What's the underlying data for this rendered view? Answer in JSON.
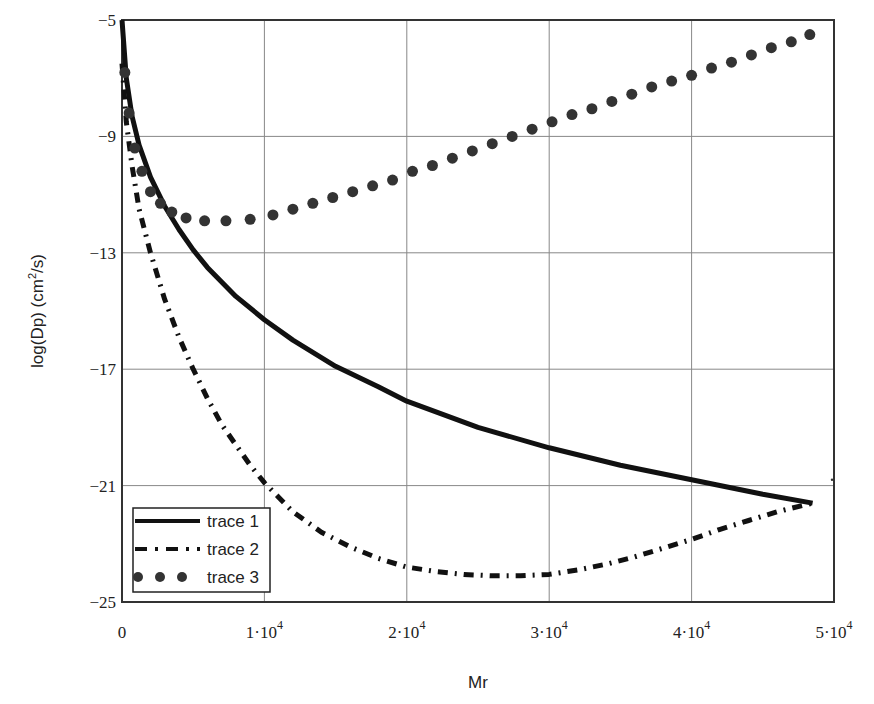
{
  "chart_data": {
    "type": "line",
    "title": "",
    "xlabel": "Mr",
    "ylabel": "log(Dp)  (cm²/s)",
    "xlim": [
      0,
      50000
    ],
    "ylim": [
      -25,
      -5
    ],
    "grid": true,
    "legend_position": "lower-left",
    "x_ticks": [
      {
        "value": 0,
        "label": "0",
        "exp": ""
      },
      {
        "value": 10000,
        "label": "1·10",
        "exp": "4"
      },
      {
        "value": 20000,
        "label": "2·10",
        "exp": "4"
      },
      {
        "value": 30000,
        "label": "3·10",
        "exp": "4"
      },
      {
        "value": 40000,
        "label": "4·10",
        "exp": "4"
      },
      {
        "value": 50000,
        "label": "5·10",
        "exp": "4"
      }
    ],
    "y_ticks": [
      {
        "value": -5,
        "label": "−5"
      },
      {
        "value": -9,
        "label": "−9"
      },
      {
        "value": -13,
        "label": "−13"
      },
      {
        "value": -17,
        "label": "−17"
      },
      {
        "value": -21,
        "label": "−21"
      },
      {
        "value": -25,
        "label": "−25"
      }
    ],
    "series": [
      {
        "name": "trace 1",
        "style": "solid",
        "color": "#111111",
        "x": [
          0,
          300,
          700,
          1200,
          2000,
          3000,
          4000,
          5000,
          6000,
          8000,
          10000,
          12000,
          15000,
          18000,
          20000,
          25000,
          30000,
          35000,
          40000,
          45000,
          48500
        ],
        "y": [
          -5.0,
          -7.0,
          -8.3,
          -9.3,
          -10.4,
          -11.4,
          -12.2,
          -12.9,
          -13.5,
          -14.5,
          -15.3,
          -16.0,
          -16.9,
          -17.6,
          -18.1,
          -19.0,
          -19.7,
          -20.3,
          -20.8,
          -21.3,
          -21.6
        ]
      },
      {
        "name": "trace 2",
        "style": "dash-dot",
        "color": "#111111",
        "x": [
          0,
          300,
          700,
          1200,
          2000,
          3000,
          4000,
          5000,
          6000,
          7000,
          8000,
          9000,
          10000,
          11000,
          12000,
          14000,
          16000,
          18000,
          20000,
          22000,
          24000,
          26000,
          28000,
          30000,
          32000,
          34000,
          36000,
          38000,
          40000,
          42000,
          44000,
          46000,
          48500
        ],
        "y": [
          -6.5,
          -8.5,
          -10.0,
          -11.5,
          -13.0,
          -14.6,
          -15.9,
          -17.0,
          -18.0,
          -18.9,
          -19.6,
          -20.3,
          -20.9,
          -21.4,
          -21.9,
          -22.6,
          -23.1,
          -23.5,
          -23.8,
          -23.95,
          -24.05,
          -24.1,
          -24.1,
          -24.05,
          -23.9,
          -23.7,
          -23.45,
          -23.15,
          -22.85,
          -22.5,
          -22.2,
          -21.9,
          -21.6
        ]
      },
      {
        "name": "trace 3",
        "style": "dots",
        "color": "#333333",
        "x": [
          200,
          500,
          900,
          1400,
          2000,
          2700,
          3500,
          4500,
          5800,
          7300,
          9000,
          10600,
          12000,
          13400,
          14800,
          16200,
          17600,
          19000,
          20400,
          21800,
          23200,
          24600,
          26000,
          27400,
          28800,
          30200,
          31600,
          33000,
          34400,
          35800,
          37200,
          38600,
          40000,
          41400,
          42800,
          44200,
          45600,
          47000,
          48300
        ],
        "y": [
          -6.8,
          -8.2,
          -9.4,
          -10.2,
          -10.9,
          -11.3,
          -11.6,
          -11.8,
          -11.9,
          -11.9,
          -11.85,
          -11.7,
          -11.5,
          -11.3,
          -11.1,
          -10.9,
          -10.7,
          -10.5,
          -10.2,
          -10.0,
          -9.75,
          -9.5,
          -9.25,
          -9.0,
          -8.75,
          -8.5,
          -8.25,
          -8.05,
          -7.8,
          -7.55,
          -7.3,
          -7.1,
          -6.9,
          -6.65,
          -6.45,
          -6.2,
          -5.95,
          -5.75,
          -5.5
        ]
      }
    ]
  },
  "legend": {
    "items": [
      {
        "label": "trace 1"
      },
      {
        "label": "trace 2"
      },
      {
        "label": "trace 3"
      }
    ]
  },
  "axes": {
    "x_title": "Mr",
    "y_title_main": "log(Dp)  (cm",
    "y_title_sup": "2",
    "y_title_tail": "/s)"
  }
}
